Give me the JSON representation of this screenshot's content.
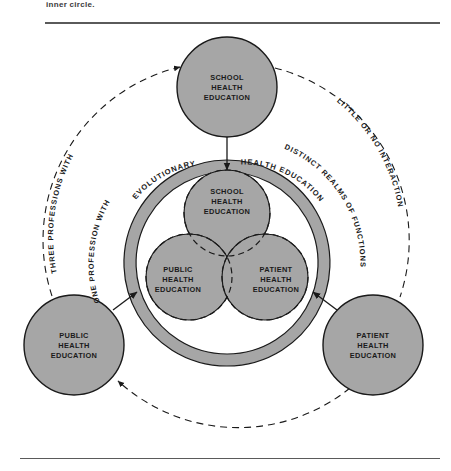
{
  "page": {
    "top_caption": "inner circle.",
    "background": "#ffffff",
    "rule_color": "#5a5a5a"
  },
  "diagram": {
    "fill_gray": "#a6a6a6",
    "stroke_dark": "#1a1a1a",
    "outer_nodes": [
      {
        "id": "school",
        "label_lines": [
          "SCHOOL",
          "HEALTH",
          "EDUCATION"
        ],
        "cx": 227,
        "cy": 87,
        "r": 50
      },
      {
        "id": "public",
        "label_lines": [
          "PUBLIC",
          "HEALTH",
          "EDUCATION"
        ],
        "cx": 74,
        "cy": 345,
        "r": 50
      },
      {
        "id": "patient",
        "label_lines": [
          "PATIENT",
          "HEALTH",
          "EDUCATION"
        ],
        "cx": 373,
        "cy": 345,
        "r": 50
      }
    ],
    "inner_nodes": [
      {
        "id": "school-inner",
        "label_lines": [
          "SCHOOL",
          "HEALTH",
          "EDUCATION"
        ],
        "cx": 227,
        "cy": 213,
        "r": 43
      },
      {
        "id": "public-inner",
        "label_lines": [
          "PUBLIC",
          "HEALTH",
          "EDUCATION"
        ],
        "cx": 189,
        "cy": 277,
        "r": 43
      },
      {
        "id": "patient-inner",
        "label_lines": [
          "PATIENT",
          "HEALTH",
          "EDUCATION"
        ],
        "cx": 265,
        "cy": 277,
        "r": 43
      }
    ],
    "ring": {
      "cx": 227,
      "cy": 263,
      "outer_r": 103,
      "inner_r": 91,
      "label_left": "ONE PROFESSION WITH",
      "label_left_on_ring": "EVOLUTIONARY",
      "label_right_on_ring": "HEALTH EDUCATION",
      "label_right": "DISTINCT REALMS OF FUNCTIONS"
    },
    "dashed_arcs": {
      "label_left": "THREE PROFESSIONS WITH",
      "label_right": "LITTLE OR NO INTERACTION"
    },
    "arrows": [
      {
        "id": "arrow-school-down",
        "from": "school",
        "to": "ring-top"
      },
      {
        "id": "arrow-public-in",
        "from": "public",
        "to": "ring-lower-left"
      },
      {
        "id": "arrow-patient-in",
        "from": "patient",
        "to": "ring-lower-right"
      },
      {
        "id": "arrow-bottom-dashed",
        "from": "patient",
        "to": "public"
      }
    ]
  }
}
